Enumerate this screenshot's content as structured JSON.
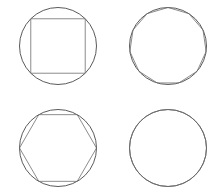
{
  "figure": {
    "background_color": "#ffffff",
    "circle_stroke_color": "#3c3c3c",
    "polygon_stroke_color": "#6e6e6e",
    "circle_stroke_width": 0.85,
    "polygon_stroke_width": 0.8,
    "canvas": {
      "width": 218,
      "height": 194
    }
  },
  "chart_data": {
    "type": "diagram",
    "xlabel": "",
    "ylabel": "",
    "grid": false,
    "legend": false,
    "panels": [
      {
        "id": "top-left",
        "name": "inscribed-square",
        "polygon_label": "square",
        "sides": 4,
        "rotation_deg": 45,
        "circle": {
          "cx": 58,
          "cy": 46,
          "r": 38.5
        },
        "polygon_radius": 38.5
      },
      {
        "id": "top-right",
        "name": "inscribed-hendecagon",
        "polygon_label": "11-gon",
        "sides": 11,
        "rotation_deg": 90,
        "circle": {
          "cx": 168,
          "cy": 46,
          "r": 38.5
        },
        "polygon_radius": 38.5
      },
      {
        "id": "bottom-left",
        "name": "inscribed-hexagon",
        "polygon_label": "hexagon",
        "sides": 6,
        "rotation_deg": 0,
        "circle": {
          "cx": 58,
          "cy": 148,
          "r": 38.5
        },
        "polygon_radius": 38.5
      },
      {
        "id": "bottom-right",
        "name": "inscribed-many-sided-polygon",
        "polygon_label": "28-gon",
        "sides": 28,
        "rotation_deg": 90,
        "circle": {
          "cx": 168,
          "cy": 148,
          "r": 38.5
        },
        "polygon_radius": 38.5
      }
    ]
  }
}
